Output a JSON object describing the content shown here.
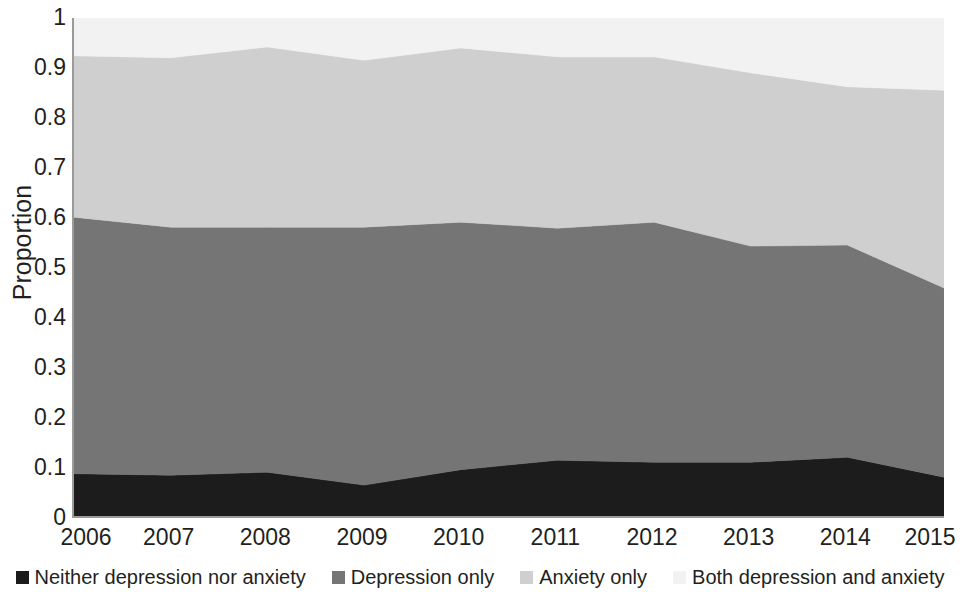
{
  "chart_data": {
    "type": "area",
    "stacked": true,
    "title": "",
    "subtitle": "",
    "xlabel": "",
    "ylabel": "Proportion",
    "x": [
      2006,
      2007,
      2008,
      2009,
      2010,
      2011,
      2012,
      2013,
      2014,
      2015
    ],
    "categories": [
      "2006",
      "2007",
      "2008",
      "2009",
      "2010",
      "2011",
      "2012",
      "2013",
      "2014",
      "2015"
    ],
    "xtick_labels": [
      "2006",
      "2007",
      "2008",
      "2009",
      "2010",
      "2011",
      "2012",
      "2013",
      "2014",
      "2015"
    ],
    "ytick_labels": [
      "1",
      "0.9",
      "0.8",
      "0.7",
      "0.6",
      "0.5",
      "0.4",
      "0.3",
      "0.2",
      "0.1",
      "0"
    ],
    "ytick_values": [
      1,
      0.9,
      0.8,
      0.7,
      0.6,
      0.5,
      0.4,
      0.3,
      0.2,
      0.1,
      0
    ],
    "ylim": [
      0,
      1
    ],
    "grid": false,
    "legend_position": "bottom",
    "series": [
      {
        "name": "Neither depression nor anxiety",
        "color": "#1c1c1c",
        "values": [
          0.085,
          0.082,
          0.088,
          0.062,
          0.093,
          0.112,
          0.108,
          0.108,
          0.118,
          0.078
        ]
      },
      {
        "name": "Depression only",
        "color": "#757575",
        "values": [
          0.515,
          0.498,
          0.492,
          0.518,
          0.497,
          0.466,
          0.482,
          0.434,
          0.426,
          0.38
        ]
      },
      {
        "name": "Anxiety only",
        "color": "#cfcfcf",
        "values": [
          0.324,
          0.34,
          0.362,
          0.335,
          0.35,
          0.344,
          0.332,
          0.348,
          0.318,
          0.397
        ]
      },
      {
        "name": "Both depression and anxiety",
        "color": "#f2f2f2",
        "values": [
          0.076,
          0.08,
          0.058,
          0.085,
          0.06,
          0.078,
          0.078,
          0.11,
          0.138,
          0.145
        ]
      }
    ],
    "cumulative_tops": {
      "neither_depression_nor_anxiety": [
        0.085,
        0.082,
        0.088,
        0.062,
        0.093,
        0.112,
        0.108,
        0.108,
        0.118,
        0.078
      ],
      "depression_only": [
        0.6,
        0.58,
        0.58,
        0.58,
        0.59,
        0.578,
        0.59,
        0.542,
        0.544,
        0.458
      ],
      "anxiety_only": [
        0.924,
        0.92,
        0.942,
        0.915,
        0.94,
        0.922,
        0.922,
        0.89,
        0.862,
        0.855
      ],
      "both_depression_and_anxiety": [
        1.0,
        1.0,
        1.0,
        1.0,
        1.0,
        1.0,
        1.0,
        1.0,
        1.0,
        1.0
      ]
    }
  },
  "axes": {
    "y_title": "Proportion"
  },
  "legend": {
    "items": [
      {
        "label": "Neither depression nor anxiety",
        "color": "#1c1c1c"
      },
      {
        "label": "Depression only",
        "color": "#757575"
      },
      {
        "label": "Anxiety only",
        "color": "#cfcfcf"
      },
      {
        "label": "Both depression and anxiety",
        "color": "#f2f2f2"
      }
    ]
  },
  "colors": {
    "axis_line": "#9b9b9b",
    "text": "#231f20",
    "plot_background": "#ffffff",
    "page_background": "#ffffff"
  }
}
